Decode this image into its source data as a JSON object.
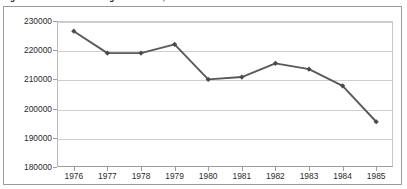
{
  "caption": "Figure 4-1. Total Black College Enrollment, Mid-1970s to Mid-1980s",
  "chart_data": {
    "type": "line",
    "title": "Figure 4-1. Total Black College Enrollment, Mid-1970s to Mid-1980s",
    "xlabel": "",
    "ylabel": "",
    "categories": [
      "1976",
      "1977",
      "1978",
      "1979",
      "1980",
      "1981",
      "1982",
      "1983",
      "1984",
      "1985"
    ],
    "values": [
      226500,
      219000,
      219000,
      222000,
      210000,
      210800,
      215500,
      213500,
      207800,
      195500
    ],
    "series": [
      {
        "name": "Total Black College Enrollment",
        "values": [
          226500,
          219000,
          219000,
          222000,
          210000,
          210800,
          215500,
          213500,
          207800,
          195500
        ]
      }
    ],
    "ylim": [
      180000,
      230000
    ],
    "yticks": [
      180000,
      190000,
      200000,
      210000,
      220000,
      230000
    ],
    "ytick_labels": [
      "180000",
      "190000",
      "200000",
      "210000",
      "220000",
      "230000"
    ],
    "grid": "horizontal",
    "legend": "none",
    "marker": "diamond",
    "line_color": "#595959",
    "marker_color": "#4a4a4a",
    "grid_color": "#cfcfcf",
    "plot_background": "#ffffff"
  }
}
